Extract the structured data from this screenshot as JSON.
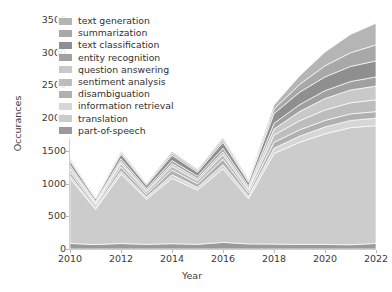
{
  "chart_data": {
    "type": "area",
    "stacked": true,
    "title": "",
    "xlabel": "Year",
    "ylabel": "Occurances",
    "x": [
      2010,
      2011,
      2012,
      2013,
      2014,
      2015,
      2016,
      2017,
      2018,
      2019,
      2020,
      2021,
      2022
    ],
    "xlim": [
      2010,
      2022
    ],
    "ylim": [
      0,
      3500
    ],
    "yticks": [
      0,
      500,
      1000,
      1500,
      2000,
      2500,
      3000,
      3500
    ],
    "xticks": [
      2010,
      2012,
      2014,
      2016,
      2018,
      2020,
      2022
    ],
    "ytick_labels": [
      "0",
      "500",
      "1000",
      "1500",
      "2000",
      "2500",
      "3000",
      "3500"
    ],
    "xtick_labels": [
      "2010",
      "2012",
      "2014",
      "2016",
      "2018",
      "2020",
      "2022"
    ],
    "grid": false,
    "legend_position": "upper left",
    "series": [
      {
        "name": "text generation",
        "color": "#b5b5b5",
        "values": [
          20,
          12,
          22,
          16,
          26,
          20,
          30,
          22,
          60,
          130,
          210,
          280,
          330
        ]
      },
      {
        "name": "summarization",
        "color": "#a8a8a8",
        "values": [
          25,
          15,
          28,
          20,
          32,
          26,
          38,
          28,
          70,
          120,
          170,
          210,
          245
        ]
      },
      {
        "name": "text classification",
        "color": "#8f8f8f",
        "values": [
          60,
          35,
          70,
          48,
          80,
          62,
          92,
          58,
          150,
          190,
          210,
          230,
          245
        ]
      },
      {
        "name": "entity recognition",
        "color": "#a0a0a0",
        "values": [
          35,
          20,
          40,
          28,
          45,
          36,
          52,
          34,
          85,
          105,
          120,
          130,
          140
        ]
      },
      {
        "name": "question answering",
        "color": "#c9c9c9",
        "values": [
          30,
          18,
          36,
          25,
          42,
          32,
          48,
          30,
          95,
          140,
          175,
          195,
          210
        ]
      },
      {
        "name": "sentiment analysis",
        "color": "#bdbdbd",
        "values": [
          45,
          26,
          52,
          36,
          60,
          46,
          70,
          42,
          110,
          140,
          160,
          170,
          180
        ]
      },
      {
        "name": "disambiguation",
        "color": "#b0b0b0",
        "values": [
          55,
          32,
          62,
          44,
          70,
          55,
          82,
          50,
          90,
          95,
          100,
          100,
          100
        ]
      },
      {
        "name": "information retrieval",
        "color": "#d6d6d6",
        "values": [
          40,
          24,
          46,
          32,
          54,
          42,
          62,
          38,
          80,
          95,
          105,
          110,
          115
        ]
      },
      {
        "name": "translation",
        "color": "#cccccc",
        "values": [
          995,
          540,
          1060,
          690,
          1000,
          830,
          1125,
          690,
          1385,
          1560,
          1690,
          1790,
          1800
        ]
      },
      {
        "name": "part-of-speech",
        "color": "#9a9a9a",
        "values": [
          85,
          68,
          84,
          71,
          81,
          71,
          101,
          78,
          75,
          70,
          70,
          65,
          85
        ]
      }
    ],
    "totals": [
      1390,
      790,
      1500,
      1010,
      1490,
      1220,
      1700,
      1070,
      2200,
      2645,
      3010,
      3280,
      3450
    ]
  },
  "legend": {
    "items": [
      {
        "label": "text generation"
      },
      {
        "label": "summarization"
      },
      {
        "label": "text classification"
      },
      {
        "label": "entity recognition"
      },
      {
        "label": "question answering"
      },
      {
        "label": "sentiment analysis"
      },
      {
        "label": "disambiguation"
      },
      {
        "label": "information retrieval"
      },
      {
        "label": "translation"
      },
      {
        "label": "part-of-speech"
      }
    ]
  }
}
